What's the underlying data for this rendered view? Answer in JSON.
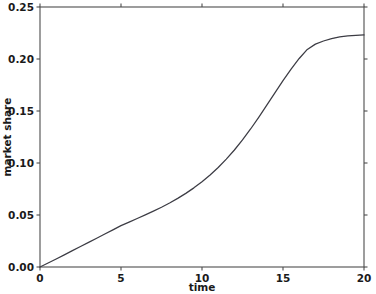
{
  "chart_data": {
    "type": "line",
    "title": "",
    "xlabel": "time",
    "ylabel": "market share",
    "xlim": [
      0,
      20
    ],
    "ylim": [
      0.0,
      0.25
    ],
    "xticks": [
      0,
      5,
      10,
      15,
      20
    ],
    "xtick_labels": [
      "0",
      "5",
      "10",
      "15",
      "20"
    ],
    "yticks": [
      0.0,
      0.05,
      0.1,
      0.15,
      0.2,
      0.25
    ],
    "ytick_labels": [
      "0.00",
      "0.05",
      "0.10",
      "0.15",
      "0.20",
      "0.25"
    ],
    "grid": false,
    "legend": false,
    "legend_position": "none",
    "line_color": "#3c3c44",
    "axis_color": "#4d4d4d",
    "background_color": "#ffffff",
    "series": [
      {
        "name": "market share",
        "x": [
          0,
          0.5,
          1,
          1.5,
          2,
          2.5,
          3,
          3.5,
          4,
          4.5,
          5,
          5.5,
          6,
          6.5,
          7,
          7.5,
          8,
          8.5,
          9,
          9.5,
          10,
          10.5,
          11,
          11.5,
          12,
          12.5,
          13,
          13.5,
          14,
          14.5,
          15,
          15.5,
          16,
          16.5,
          17,
          17.5,
          18,
          18.5,
          19,
          19.5,
          20
        ],
        "y": [
          0.0,
          0.0038,
          0.0077,
          0.0117,
          0.0157,
          0.0197,
          0.0237,
          0.0277,
          0.0317,
          0.0357,
          0.0398,
          0.0432,
          0.0466,
          0.0501,
          0.0537,
          0.0575,
          0.0616,
          0.066,
          0.0708,
          0.0761,
          0.082,
          0.0885,
          0.0957,
          0.1037,
          0.1125,
          0.1222,
          0.1327,
          0.1439,
          0.1556,
          0.1675,
          0.1792,
          0.1903,
          0.2005,
          0.2092,
          0.2143,
          0.2173,
          0.2196,
          0.2212,
          0.2222,
          0.2228,
          0.2231
        ]
      }
    ]
  },
  "axes": {
    "xlabel": "time",
    "ylabel": "market share"
  }
}
